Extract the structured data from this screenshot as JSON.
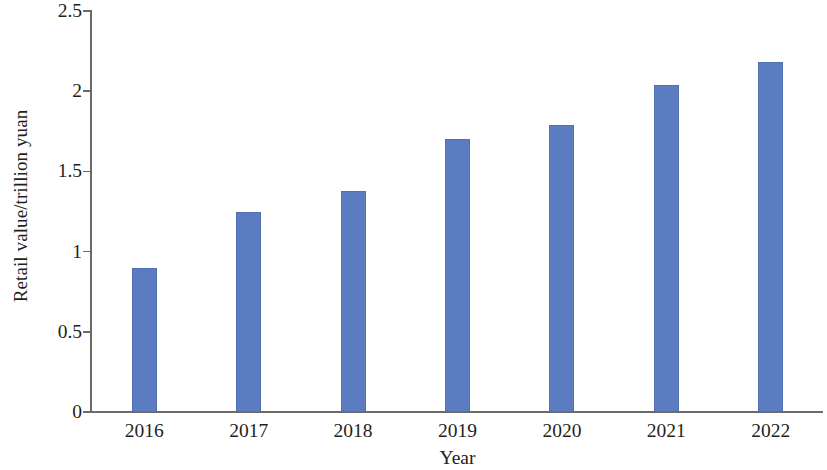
{
  "chart_data": {
    "type": "bar",
    "title": "",
    "subtitle": "",
    "categories": [
      "2016",
      "2017",
      "2018",
      "2019",
      "2020",
      "2021",
      "2022"
    ],
    "values": [
      0.9,
      1.25,
      1.38,
      1.7,
      1.79,
      2.04,
      2.18
    ],
    "series": [
      {
        "name": "Retail value",
        "values": [
          0.9,
          1.25,
          1.38,
          1.7,
          1.79,
          2.04,
          2.18
        ]
      }
    ],
    "xlabel": "Year",
    "ylabel": "Retail value/trillion yuan",
    "ylim": [
      0,
      2.5
    ],
    "ytick_labels": [
      "2.5",
      "2",
      "1.5",
      "1",
      "0.5",
      "0"
    ],
    "ytick_values": [
      2.5,
      2,
      1.5,
      1,
      0.5,
      0
    ],
    "grid": false,
    "legend": false,
    "legend_position": "none",
    "bar_color": "#5b7cc0",
    "axis_color": "#6a6a6a",
    "background_color": "#ffffff",
    "text_color": "#231f20"
  },
  "axes": {
    "y_title": "Retail value/trillion yuan",
    "x_title": "Year"
  },
  "y_ticks": [
    {
      "label": "2.5",
      "value": 2.5
    },
    {
      "label": "2",
      "value": 2
    },
    {
      "label": "1.5",
      "value": 1.5
    },
    {
      "label": "1",
      "value": 1
    },
    {
      "label": "0.5",
      "value": 0.5
    },
    {
      "label": "0",
      "value": 0
    }
  ],
  "bars": [
    {
      "category": "2016",
      "value": 0.9
    },
    {
      "category": "2017",
      "value": 1.25
    },
    {
      "category": "2018",
      "value": 1.38
    },
    {
      "category": "2019",
      "value": 1.7
    },
    {
      "category": "2020",
      "value": 1.79
    },
    {
      "category": "2021",
      "value": 2.04
    },
    {
      "category": "2022",
      "value": 2.18
    }
  ]
}
